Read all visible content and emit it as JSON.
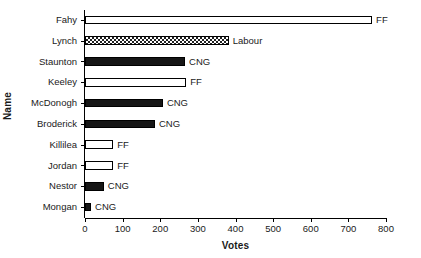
{
  "chart_data": {
    "type": "bar",
    "orientation": "horizontal",
    "title": "",
    "xlabel": "Votes",
    "ylabel": "Name",
    "categories": [
      "Fahy",
      "Lynch",
      "Staunton",
      "Keeley",
      "McDonogh",
      "Broderick",
      "Killilea",
      "Jordan",
      "Nestor",
      "Mongan"
    ],
    "values": [
      763,
      382,
      266,
      269,
      207,
      186,
      75,
      75,
      50,
      16
    ],
    "point_labels": [
      "FF",
      "Labour",
      "CNG",
      "FF",
      "CNG",
      "CNG",
      "FF",
      "FF",
      "CNG",
      "CNG"
    ],
    "fills": [
      "white",
      "checker",
      "black",
      "white",
      "black",
      "black",
      "white",
      "white",
      "black",
      "black"
    ],
    "xlim": [
      0,
      800
    ],
    "xticks": [
      0,
      100,
      200,
      300,
      400,
      500,
      600,
      700,
      800
    ],
    "xtick_labels": [
      "0",
      "100",
      "200",
      "300",
      "400",
      "500",
      "600",
      "700",
      "800"
    ],
    "grid": false,
    "legend": "none",
    "colors": {
      "outline": "#000000",
      "bar_fill_dark": "#161616",
      "bar_fill_light": "#ffffff",
      "background": "#ffffff",
      "text": "#1a1a1a"
    }
  },
  "axes": {
    "x_title": "Votes",
    "y_title": "Name"
  },
  "bars": [
    {
      "name": "Fahy",
      "value": 763,
      "label": "FF",
      "fill": "white"
    },
    {
      "name": "Lynch",
      "value": 382,
      "label": "Labour",
      "fill": "checker"
    },
    {
      "name": "Staunton",
      "value": 266,
      "label": "CNG",
      "fill": "black"
    },
    {
      "name": "Keeley",
      "value": 269,
      "label": "FF",
      "fill": "white"
    },
    {
      "name": "McDonogh",
      "value": 207,
      "label": "CNG",
      "fill": "black"
    },
    {
      "name": "Broderick",
      "value": 186,
      "label": "CNG",
      "fill": "black"
    },
    {
      "name": "Killilea",
      "value": 75,
      "label": "FF",
      "fill": "white"
    },
    {
      "name": "Jordan",
      "value": 75,
      "label": "FF",
      "fill": "white"
    },
    {
      "name": "Nestor",
      "value": 50,
      "label": "CNG",
      "fill": "black"
    },
    {
      "name": "Mongan",
      "value": 16,
      "label": "CNG",
      "fill": "black"
    }
  ]
}
